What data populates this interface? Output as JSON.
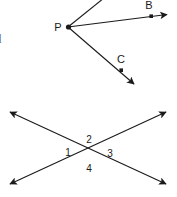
{
  "figure": {
    "background_color": "#ffffff",
    "stroke_color": "#1a1a1a",
    "margin_text": [
      {
        "id": "frag1",
        "text": "e"
      },
      {
        "id": "frag2",
        "text": "d"
      }
    ],
    "angle_figure": {
      "vertex_label": "P",
      "point_labels": [
        "B",
        "C"
      ],
      "rays": [
        {
          "name": "ray-up",
          "label": ""
        },
        {
          "name": "ray-to-b",
          "label": "B"
        },
        {
          "name": "ray-to-c",
          "label": "C"
        }
      ]
    },
    "intersecting_lines_figure": {
      "angle_labels": [
        "1",
        "2",
        "3",
        "4"
      ],
      "angle_positions": [
        "left",
        "top",
        "right",
        "bottom"
      ],
      "line_count": 2,
      "arrow_ends": 4
    }
  }
}
